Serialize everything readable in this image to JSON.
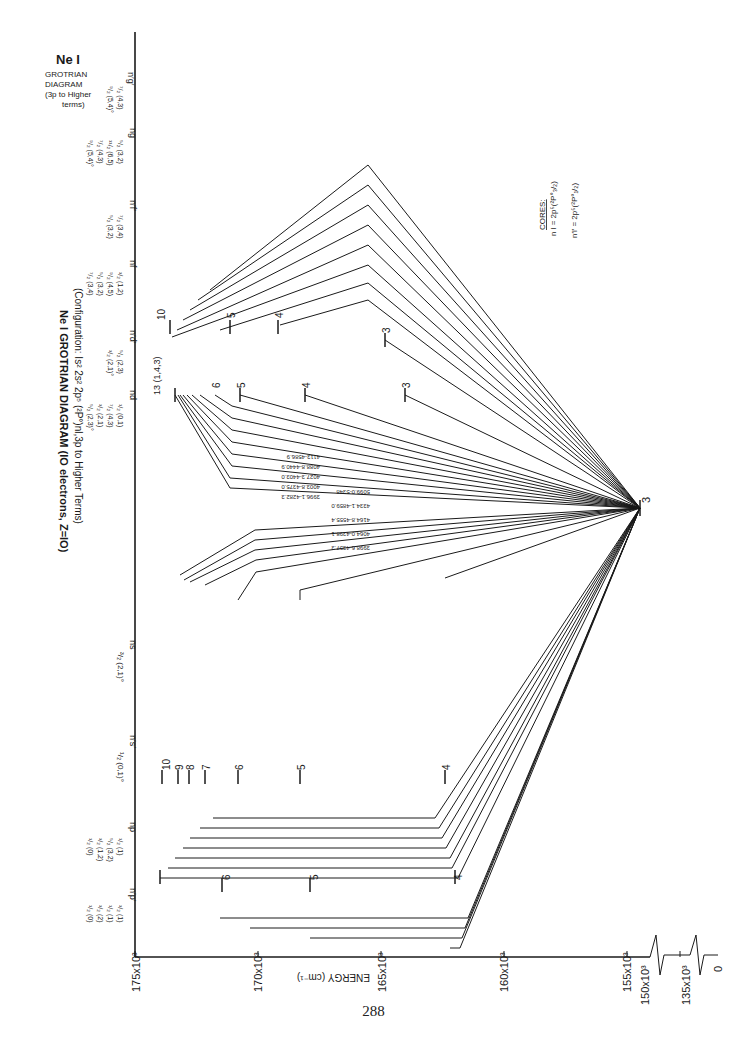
{
  "corner_label": {
    "element": "Ne I",
    "lines": [
      "GROTRIAN",
      "DIAGRAM",
      "(3p to Higher",
      "terms)"
    ]
  },
  "title": {
    "main": "Ne I  GROTRIAN  DIAGRAM  (IO electrons, Z=IO)",
    "config": "(Configuration: Is² 2s² 2p⁵ (²P°)nl,3p to Higher Terms)"
  },
  "columns": [
    {
      "id": "ns",
      "label": "ns",
      "terms": [
        "³/₂ (2,1)°"
      ]
    },
    {
      "id": "n's'",
      "label": "n′s′",
      "terms": [
        "¹/₂ (0,1)°"
      ]
    },
    {
      "id": "np",
      "label": "np",
      "terms": [
        "¹/₂ (0)",
        "³/₂ (1,2)",
        "⁵/₂ (3,2)",
        "¹/₂ (1)"
      ]
    },
    {
      "id": "n'p'",
      "label": "n′p′",
      "terms": [
        "¹/₂ (0)",
        "³/₂ (2)",
        "¹/₂ (1)",
        "³/₂ (1)"
      ]
    },
    {
      "id": "nd",
      "label": "nd",
      "terms": [
        "⁵/₂ (2,3)°",
        "³/₂ (2,1)",
        "⁷/₂ (4,3)",
        "¹/₂ (0,1)"
      ]
    },
    {
      "id": "n'd'",
      "label": "n′d′",
      "terms": [
        "³/₂ (2,1)°",
        "⁵/₂ (2,3)"
      ]
    },
    {
      "id": "nf",
      "label": "nf",
      "terms": [
        "⁷/₂ (3,4)",
        "⁵/₂ (3,2)",
        "⁹/₂ (4,5)",
        "³/₂ (1,2)"
      ]
    },
    {
      "id": "n'f'",
      "label": "n′f′",
      "terms": [
        "⁵/₂ (3,2)",
        "⁷/₂ (3,4)"
      ]
    },
    {
      "id": "ng",
      "label": "ng",
      "terms": [
        "⁹/₂ (5,4)°",
        "⁷/₂ (4,3)",
        "¹¹/₂ (6,5)",
        "⁵/₂ (3,2)"
      ]
    },
    {
      "id": "n'g'",
      "label": "n′g′",
      "terms": [
        "⁹/₂ (5,4)°",
        "⁷/₂ (4,3)"
      ]
    }
  ],
  "axis": {
    "label": "ENERGY (cm⁻¹)",
    "ticks": [
      "175x10³",
      "170x10³",
      "165x10³",
      "160x10³",
      "155x10³",
      "150x10³",
      "135x10³",
      "0"
    ]
  },
  "origin_level": {
    "label": "3",
    "term": "3p"
  },
  "level_labels": {
    "ns": [
      "13",
      "12",
      "11",
      "10",
      "9",
      "8",
      "7",
      "6",
      "5",
      "4"
    ],
    "n's'": [
      "10",
      "9",
      "8",
      "7",
      "6",
      "5",
      "4"
    ],
    "nd": [
      "13 (1,4,3)",
      "12",
      "11",
      "10",
      "9",
      "8",
      "7",
      "6",
      "5",
      "4",
      "3"
    ],
    "n'd'": [
      "10",
      "9",
      "8",
      "7",
      "6",
      "5",
      "4",
      "3"
    ],
    "n'd'_box": "³/₂ ⁵/₂ (1-3)"
  },
  "transitions": {
    "ns_group": [
      "8865.3-8607.6",
      "4020.0-4345.8",
      "4340.0-4375.0",
      "4079.4-4410.5",
      "4268.9-4565.5",
      "4164.4-4723.8",
      "4303.2-4885.6",
      "3466.1-3680.7",
      "5662.1-5886.3",
      "4887.3-5538.1",
      "4452.0-5006.3"
    ],
    "n's'_group": [
      "3998.6-4357.3",
      "4064.0-4398.1",
      "4164.8-4555.4",
      "4334.1-4859.0",
      "5099.0-5348",
      "5433.7-5835.9"
    ],
    "nd_group": [
      "3996.1-4282.3",
      "4003.8-4375.0",
      "4027.3-4403.0",
      "4088.8-4440.9",
      "4113-4586.9",
      "4174.0-4696.9",
      "4267.3-4886.9",
      "4420.6-5062",
      "4698.6-4898.3",
      "5320.6-6237",
      "7472.4-9425.6"
    ],
    "n'd'_group": [
      "3984.0-4205.6",
      "3984.1-4264.1",
      "4042.3-4320.2",
      "4303.5-4690.4",
      "4274.7-4851.2",
      "4398.5-5005.3",
      "4713.7-5069.9",
      "5752.0-8679.8"
    ]
  },
  "cores": {
    "heading": "CORES:",
    "lines": [
      "n l = 2p⁵(²P°₃/₂)",
      "n′l′ = 2p⁵(²P°₁/₂)"
    ]
  },
  "page_number": "288"
}
